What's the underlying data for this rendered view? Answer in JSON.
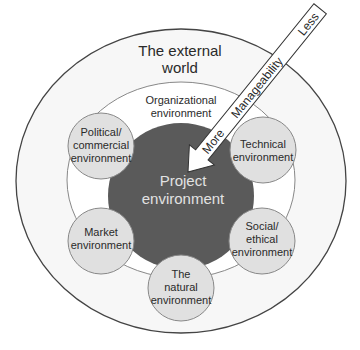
{
  "diagram": {
    "outer": {
      "label_line1": "The external",
      "label_line2": "world"
    },
    "organizational": {
      "label_line1": "Organizational",
      "label_line2": "environment"
    },
    "project": {
      "label_line1": "Project",
      "label_line2": "environment"
    },
    "satellites": [
      {
        "id": "political",
        "lines": [
          "Political/",
          "commercial",
          "environment"
        ]
      },
      {
        "id": "technical",
        "lines": [
          "Technical",
          "environment"
        ]
      },
      {
        "id": "market",
        "lines": [
          "Market",
          "environment"
        ]
      },
      {
        "id": "social",
        "lines": [
          "Social/",
          "ethical",
          "environment"
        ]
      },
      {
        "id": "natural",
        "lines": [
          "The",
          "natural",
          "environment"
        ]
      }
    ],
    "arrow": {
      "more": "More",
      "middle": "Manageability",
      "less": "Less"
    }
  },
  "colors": {
    "outer_fill": "#f7f7f7",
    "org_fill": "#ffffff",
    "project_fill": "#5a5a5a",
    "satellite_fill": "#e0e0e0",
    "stroke": "#555555"
  }
}
